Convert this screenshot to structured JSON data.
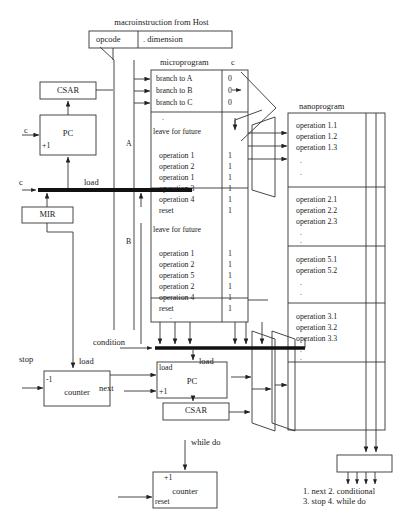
{
  "diagram": {
    "title": "macroinstruction from Host",
    "macroinstruction": {
      "opcode_label": "opcode",
      "dimension_label": ". dimension"
    },
    "microprogram": {
      "title": "microprogram",
      "c_column_header": "c",
      "section_a_label": "A",
      "section_b_label": "B",
      "branch_rows": [
        {
          "text": "branch to A",
          "c": "0"
        },
        {
          "text": "branch to B",
          "c": "0"
        },
        {
          "text": "branch to C",
          "c": "0"
        }
      ],
      "ellipsis_1": ".",
      "leave_for_future_1": "leave for future",
      "block_a_rows": [
        {
          "text": "operation 1",
          "c": "1"
        },
        {
          "text": "operation 2",
          "c": "1"
        },
        {
          "text": "operation 1",
          "c": "1"
        },
        {
          "text": "operation 3",
          "c": "1"
        },
        {
          "text": "operation 4",
          "c": "1"
        },
        {
          "text": "reset",
          "c": "1"
        }
      ],
      "leave_for_future_2": "leave for future",
      "block_b_rows": [
        {
          "text": "operation 1",
          "c": "1"
        },
        {
          "text": "operation 2",
          "c": "1"
        },
        {
          "text": "operation 5",
          "c": "1"
        },
        {
          "text": "operation 2",
          "c": "1"
        },
        {
          "text": "operation 4",
          "c": "1"
        },
        {
          "text": "reset",
          "c": "1"
        }
      ],
      "ellipsis_2": ".",
      "ellipsis_3": "."
    },
    "nanoprogram": {
      "title": "nanoprogram",
      "blocks": [
        {
          "rows": [
            "operation 1.1",
            "operation 1.2",
            "operation 1.3"
          ],
          "dots": [
            ".",
            "."
          ]
        },
        {
          "rows": [
            "operation 2.1",
            "operation 2.2",
            "operation 2.3"
          ],
          "dots": [
            ".",
            "."
          ]
        },
        {
          "rows": [
            "operation 5.1",
            "operation 5.2"
          ],
          "dots": [
            ".",
            "."
          ]
        },
        {
          "rows": [
            "operation 3.1",
            "operation 3.2",
            "operation 3.3"
          ],
          "dots": [
            ".",
            "."
          ]
        }
      ]
    },
    "registers": {
      "csar_top": "CSAR",
      "csar_bottom": "CSAR",
      "pc_top": "PC",
      "pc_bottom": "PC",
      "mir": "MIR",
      "counter_left": "counter",
      "counter_bottom": "counter"
    },
    "signals": {
      "c_left_upper": "c",
      "c_left_lower": "c",
      "plus1_pc_top": "+1",
      "plus1_pc_bottom": "+1",
      "plus1_counter": "+1",
      "minus1_counter": "-1",
      "load_top": "load",
      "load_counter": "load",
      "load_pc": "load",
      "load_bus": "load",
      "condition": "condition",
      "stop": "stop",
      "next": "next",
      "reset": "reset",
      "while_do": "while do"
    },
    "legend": {
      "line1": "1. next 2. conditional",
      "line2": "3. stop 4. while do"
    }
  }
}
